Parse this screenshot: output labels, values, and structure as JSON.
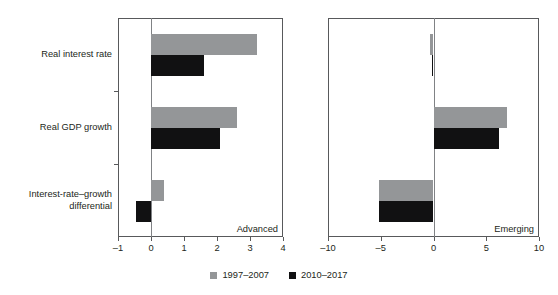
{
  "chart_data": {
    "type": "bar",
    "orientation": "horizontal",
    "title": "",
    "xlabel": "",
    "ylabel": "",
    "grid": false,
    "legend_position": "bottom-center",
    "categories": [
      "Real interest rate",
      "Real GDP growth",
      "Interest-rate–growth\ndifferential"
    ],
    "series": [
      {
        "name": "1997–2007",
        "color": "#949698"
      },
      {
        "name": "2010–2017",
        "color": "#111112"
      }
    ],
    "panels": [
      {
        "name": "Advanced",
        "caption": "Advanced",
        "xlim": [
          -1,
          4
        ],
        "xticks": [
          -1,
          0,
          1,
          2,
          3,
          4
        ],
        "xticklabels": [
          "–1",
          "0",
          "1",
          "2",
          "3",
          "4"
        ],
        "series": [
          {
            "name": "1997–2007",
            "values": [
              3.2,
              2.6,
              0.4
            ]
          },
          {
            "name": "2010–2017",
            "values": [
              1.6,
              2.1,
              -0.45
            ]
          }
        ]
      },
      {
        "name": "Emerging",
        "caption": "Emerging",
        "xlim": [
          -10,
          10
        ],
        "xticks": [
          -10,
          -5,
          0,
          5,
          10
        ],
        "xticklabels": [
          "–10",
          "–5",
          "0",
          "5",
          "10"
        ],
        "series": [
          {
            "name": "1997–2007",
            "values": [
              -0.35,
              7.0,
              -5.2
            ]
          },
          {
            "name": "2010–2017",
            "values": [
              -0.1,
              6.2,
              -5.2
            ]
          }
        ]
      }
    ]
  },
  "legend": {
    "items": [
      {
        "label": "1997–2007",
        "color": "#949698"
      },
      {
        "label": "2010–2017",
        "color": "#111112"
      }
    ]
  },
  "colors": {
    "series_1997_2007": "#949698",
    "series_2010_2017": "#111112",
    "axis": "#58595b",
    "zero_line": "#808285",
    "text": "#231f20",
    "background": "#ffffff"
  }
}
